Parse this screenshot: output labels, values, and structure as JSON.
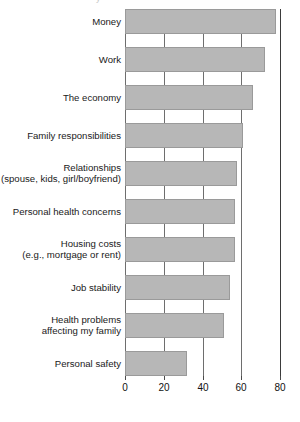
{
  "chart_data": {
    "type": "bar",
    "orientation": "horizontal",
    "title": "",
    "clipped_header_text": "y",
    "xlabel": "",
    "ylabel": "",
    "xlim": [
      0,
      80
    ],
    "xticks": [
      0,
      20,
      40,
      60,
      80
    ],
    "xtick_labels": [
      "0",
      "20",
      "40",
      "60",
      "80"
    ],
    "grid": true,
    "grid_axis": "x",
    "legend": "none",
    "bar_color": "#b7b7b7",
    "bar_edge_color": "#9a9a9a",
    "axis_color": "#3b3b3b",
    "categories": [
      "Money",
      "Work",
      "The economy",
      "Family responsibilities",
      "Relationships\n(spouse, kids, girl/boyfriend)",
      "Personal health concerns",
      "Housing costs\n(e.g., mortgage or rent)",
      "Job stability",
      "Health problems\naffecting my family",
      "Personal safety"
    ],
    "values": [
      78,
      72,
      66,
      61,
      58,
      57,
      57,
      54,
      51,
      32
    ]
  }
}
